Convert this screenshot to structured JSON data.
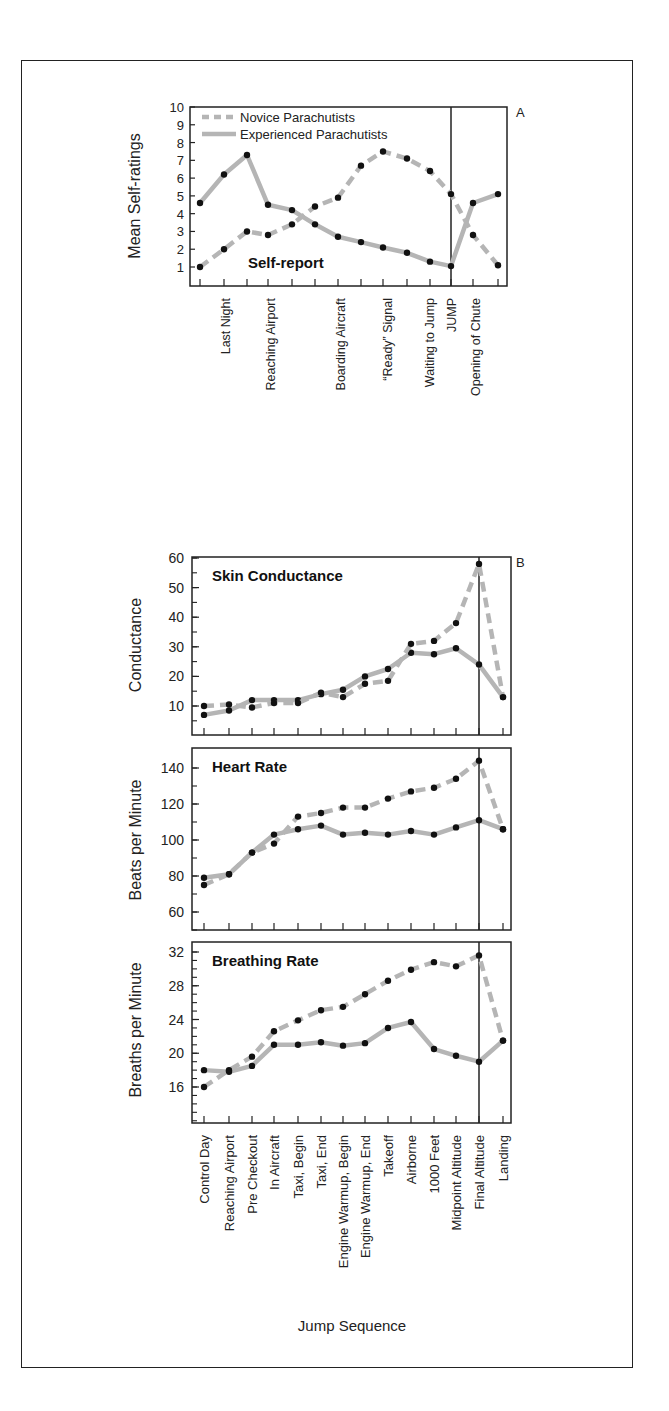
{
  "chart_data": [
    {
      "id": "A",
      "type": "line",
      "panel_label": "A",
      "title": "Self-report",
      "xlabel": "",
      "ylabel": "Mean Self-ratings",
      "ylim": [
        1,
        10
      ],
      "yticks": [
        1,
        2,
        3,
        4,
        5,
        6,
        7,
        8,
        9,
        10
      ],
      "category_labels": [
        "Last Night",
        "Reaching Airport",
        "Boarding Aircraft",
        "“Ready” Signal",
        "Waiting to Jump",
        "JUMP",
        "Opening of Chute"
      ],
      "n_points": 14,
      "event_marker": {
        "label": "JUMP",
        "index": 11
      },
      "legend": [
        {
          "name": "Novice Parachutists",
          "style": "dashed"
        },
        {
          "name": "Experienced Parachutists",
          "style": "solid"
        }
      ],
      "series": [
        {
          "name": "Novice Parachutists",
          "values": [
            1.0,
            2.0,
            3.0,
            2.8,
            3.4,
            4.4,
            4.9,
            6.7,
            7.5,
            7.1,
            6.4,
            5.1,
            2.8,
            1.1
          ]
        },
        {
          "name": "Experienced Parachutists",
          "values": [
            4.6,
            6.2,
            7.3,
            4.5,
            4.2,
            3.4,
            2.7,
            2.4,
            2.1,
            1.8,
            1.3,
            1.05,
            4.6,
            5.1
          ]
        }
      ]
    },
    {
      "id": "B",
      "type": "line",
      "panel_label": "B",
      "xlabel": "Jump Sequence",
      "categories": [
        "Control Day",
        "Reaching Airport",
        "Pre Checkout",
        "In Aircraft",
        "Taxi, Begin",
        "Taxi, End",
        "Engine Warmup, Begin",
        "Engine Warmup, End",
        "Takeoff",
        "Airborne",
        "1000 Feet",
        "Midpoint Altitude",
        "Final Altitude",
        "Landing"
      ],
      "event_marker": {
        "label": "Final Altitude",
        "index": 12
      },
      "panels": [
        {
          "title": "Skin Conductance",
          "ylabel": "Conductance",
          "ylim": [
            0,
            60
          ],
          "yticks": [
            10,
            20,
            30,
            40,
            50,
            60
          ],
          "series": [
            {
              "name": "Novice Parachutists",
              "values": [
                10,
                10.5,
                9.5,
                11,
                11,
                14.5,
                13,
                17.5,
                18.5,
                31,
                32,
                38,
                58,
                13
              ]
            },
            {
              "name": "Experienced Parachutists",
              "values": [
                7,
                8.5,
                12,
                12,
                12,
                14,
                15.5,
                20,
                22.5,
                28,
                27.5,
                29.5,
                24,
                13
              ]
            }
          ]
        },
        {
          "title": "Heart Rate",
          "ylabel": "Beats per Minute",
          "ylim": [
            50,
            150
          ],
          "yticks": [
            60,
            80,
            100,
            120,
            140
          ],
          "series": [
            {
              "name": "Novice Parachutists",
              "values": [
                75,
                81,
                93,
                98,
                113,
                115,
                118,
                118,
                123,
                127,
                129,
                134,
                144,
                106
              ]
            },
            {
              "name": "Experienced Parachutists",
              "values": [
                79,
                81,
                93,
                103,
                106,
                108,
                103,
                104,
                103,
                105,
                103,
                107,
                111,
                106
              ]
            }
          ]
        },
        {
          "title": "Breathing Rate",
          "ylabel": "Breaths per Minute",
          "ylim": [
            12,
            32.5
          ],
          "yticks": [
            16,
            20,
            24,
            28,
            32
          ],
          "series": [
            {
              "name": "Novice Parachutists",
              "values": [
                16,
                18,
                19.6,
                22.6,
                23.9,
                25.1,
                25.5,
                27,
                28.6,
                29.9,
                30.8,
                30.3,
                31.6,
                21.5
              ]
            },
            {
              "name": "Experienced Parachutists",
              "values": [
                18,
                17.8,
                18.5,
                21,
                21,
                21.3,
                20.9,
                21.2,
                23,
                23.7,
                20.5,
                19.7,
                19,
                21.5
              ]
            }
          ]
        }
      ]
    }
  ],
  "colors": {
    "line": "#b5b5b5",
    "marker": "#111111",
    "axis": "#222222"
  }
}
